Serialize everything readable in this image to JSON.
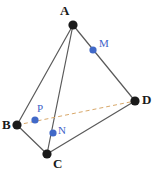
{
  "figure": {
    "type": "tetrahedron-diagram",
    "width": 156,
    "height": 174,
    "background_color": "#ffffff",
    "colors": {
      "edge": "#5a5a5a",
      "hidden_edge": "#d8a86a",
      "vertex_dot": "#1a1a1a",
      "vertex_label": "#1a1a1a",
      "marked_point_dot": "#4169c8",
      "marked_point_label": "#3d63c8"
    },
    "vertices": [
      {
        "id": "A",
        "label": "A",
        "x": 73,
        "y": 25,
        "r": 4.6,
        "label_x": 60,
        "label_y": 4
      },
      {
        "id": "B",
        "label": "B",
        "x": 17,
        "y": 125,
        "r": 4.6,
        "label_x": 2,
        "label_y": 118
      },
      {
        "id": "C",
        "label": "C",
        "x": 47,
        "y": 154,
        "r": 4.6,
        "label_x": 53,
        "label_y": 157
      },
      {
        "id": "D",
        "label": "D",
        "x": 135,
        "y": 101,
        "r": 4.6,
        "label_x": 142,
        "label_y": 93
      }
    ],
    "marked_points": [
      {
        "id": "M",
        "label": "M",
        "x": 93,
        "y": 50,
        "r": 3.6,
        "on_edge": "A-D",
        "label_x": 99,
        "label_y": 38
      },
      {
        "id": "N",
        "label": "N",
        "x": 53,
        "y": 133,
        "r": 3.6,
        "on_edge": "A-C",
        "label_x": 58,
        "label_y": 125
      },
      {
        "id": "P",
        "label": "P",
        "x": 35,
        "y": 120,
        "r": 3.6,
        "on_edge": "",
        "label_x": 37,
        "label_y": 103
      }
    ],
    "solid_edges": [
      {
        "id": "A-B",
        "from": "A",
        "to": "B",
        "x1": 73,
        "y1": 25,
        "x2": 17,
        "y2": 125
      },
      {
        "id": "A-C",
        "from": "A",
        "to": "C",
        "x1": 73,
        "y1": 25,
        "x2": 47,
        "y2": 154
      },
      {
        "id": "A-D",
        "from": "A",
        "to": "D",
        "x1": 73,
        "y1": 25,
        "x2": 135,
        "y2": 101
      },
      {
        "id": "B-C",
        "from": "B",
        "to": "C",
        "x1": 17,
        "y1": 125,
        "x2": 47,
        "y2": 154
      },
      {
        "id": "C-D",
        "from": "C",
        "to": "D",
        "x1": 47,
        "y1": 154,
        "x2": 135,
        "y2": 101
      }
    ],
    "dashed_edges": [
      {
        "id": "B-D",
        "from": "B",
        "to": "D",
        "x1": 17,
        "y1": 125,
        "x2": 135,
        "y2": 101,
        "dash": "4 3"
      }
    ]
  }
}
